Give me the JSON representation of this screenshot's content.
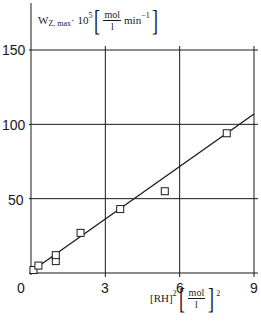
{
  "chart_data": {
    "type": "scatter",
    "title": "",
    "xlabel": "[RH]^2 [mol/l]^2",
    "ylabel": "W_Z,max · 10^5 [mol/l min^-1]",
    "xlim": [
      0,
      9
    ],
    "ylim": [
      0,
      150
    ],
    "x_ticks": [
      "0",
      "3",
      "6",
      "9"
    ],
    "y_ticks": [
      "50",
      "100",
      "150"
    ],
    "grid": true,
    "legend": null,
    "series": [
      {
        "name": "measured",
        "marker": "open-square",
        "points": [
          {
            "x": 0.1,
            "y": 2
          },
          {
            "x": 0.3,
            "y": 5
          },
          {
            "x": 1.0,
            "y": 8
          },
          {
            "x": 1.0,
            "y": 12
          },
          {
            "x": 2.0,
            "y": 27
          },
          {
            "x": 3.6,
            "y": 43
          },
          {
            "x": 5.4,
            "y": 55
          },
          {
            "x": 7.9,
            "y": 94
          }
        ]
      },
      {
        "name": "linear fit",
        "style": "line",
        "points": [
          {
            "x": 0.0,
            "y": 1
          },
          {
            "x": 9.0,
            "y": 107
          }
        ]
      }
    ]
  },
  "labels": {
    "y_axis": {
      "w": "W",
      "sub": "Z, max",
      "mult": " · 10",
      "exp": "5",
      "num": "mol",
      "den": "l",
      "unit": "min",
      "unit_exp": "−1"
    },
    "x_axis": {
      "var": "[RH]",
      "exp": "2",
      "num": "mol",
      "den": "l",
      "outer_exp": "2"
    },
    "ticks": {
      "x0": "0",
      "x3": "3",
      "x6": "6",
      "x9": "9",
      "y50": "50",
      "y100": "100",
      "y150": "150"
    }
  }
}
